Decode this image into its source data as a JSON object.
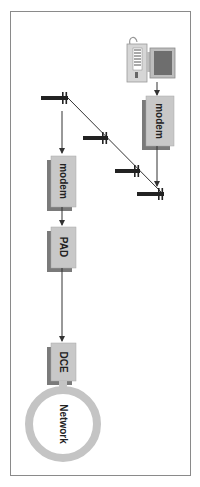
{
  "diagram": {
    "orientation": "rotated-90-clockwise",
    "nodes": {
      "computer": {
        "label": "",
        "icon": "computer-icon"
      },
      "modem_remote": {
        "label": "modem"
      },
      "modem_local": {
        "label": "modem"
      },
      "pad": {
        "label": "PAD"
      },
      "dce": {
        "label": "DCE"
      },
      "network": {
        "label": "Network"
      }
    },
    "colors": {
      "box_fill": "#c8c8c8",
      "box_shadow": "#7a7a7a",
      "ring": "#c4c4c4",
      "line": "#333333",
      "frame": "#8a8a8a"
    }
  }
}
